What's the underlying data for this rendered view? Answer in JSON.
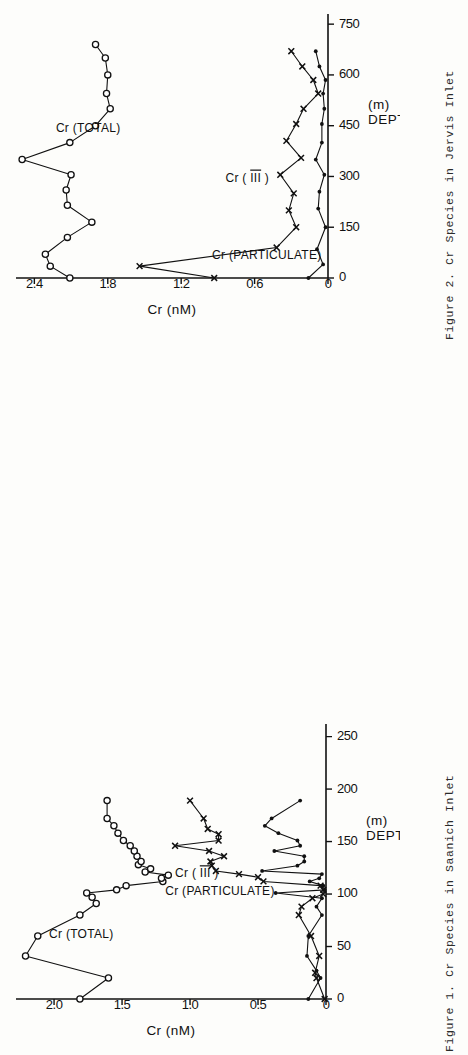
{
  "page": {
    "width": 468,
    "height": 711,
    "background_color": "#fdfdfb",
    "ink_color": "#111111",
    "orientation_note": "two landscape figures rotated 90 degrees on a portrait page"
  },
  "figures": [
    {
      "id": "figure-2",
      "caption": "Figure 2.  Cr Species in Jervis Inlet",
      "caption_number": "Figure 2.",
      "caption_text": "Cr Species in Jervis Inlet"
    },
    {
      "id": "figure-1",
      "caption": "Figure 1.  Cr Species in Saanich Inlet",
      "caption_number": "Figure 1.",
      "caption_text": "Cr Species in Saanich Inlet"
    }
  ],
  "chart_data": [
    {
      "id": "figure-2",
      "type": "line",
      "title": "Cr Species in Jervis Inlet",
      "xlabel": "DEPTH (m)",
      "ylabel": "Cr (nM)",
      "xlim": [
        0,
        780
      ],
      "ylim": [
        0,
        2.55
      ],
      "xticks": [
        0,
        150,
        300,
        450,
        600,
        750
      ],
      "xtick_labels": [
        "0",
        "150",
        "300",
        "450",
        "600",
        "750"
      ],
      "yticks": [
        0,
        0.6,
        1.2,
        1.8,
        2.4
      ],
      "ytick_labels": [
        "0",
        "0.6",
        "1.2",
        "1.8",
        "2.4"
      ],
      "grid": false,
      "legend": "inline annotations",
      "series": [
        {
          "name": "Cr (TOTAL)",
          "marker": "open-circle",
          "label_x": 430,
          "label_y": 1.96,
          "x": [
            0,
            35,
            70,
            120,
            165,
            215,
            260,
            305,
            350,
            400,
            450,
            500,
            545,
            600,
            650,
            690
          ],
          "y": [
            2.11,
            2.27,
            2.31,
            2.13,
            1.93,
            2.13,
            2.14,
            2.1,
            2.5,
            2.11,
            1.9,
            1.78,
            1.81,
            1.8,
            1.82,
            1.9
          ]
        },
        {
          "name": "Cr (III)",
          "marker": "x",
          "label_x": 285,
          "label_y": 0.66,
          "x": [
            0,
            35,
            90,
            150,
            200,
            250,
            305,
            355,
            405,
            455,
            500,
            545,
            585,
            625,
            670
          ],
          "y": [
            0.93,
            1.54,
            0.42,
            0.26,
            0.32,
            0.28,
            0.39,
            0.22,
            0.34,
            0.26,
            0.2,
            0.08,
            0.12,
            0.21,
            0.3
          ]
        },
        {
          "name": "Cr (PARTICULATE)",
          "marker": "filled-dot",
          "label_x": 55,
          "label_y": 0.5,
          "x": [
            0,
            40,
            85,
            150,
            205,
            255,
            305,
            350,
            400,
            455,
            500,
            545,
            585,
            625,
            670
          ],
          "y": [
            0.16,
            0.04,
            0.09,
            0.02,
            0.08,
            0.07,
            0.03,
            0.1,
            0.05,
            0.05,
            0.03,
            0.04,
            0.02,
            0.07,
            0.1
          ]
        }
      ]
    },
    {
      "id": "figure-1",
      "type": "line",
      "title": "Cr Species in Saanich Inlet",
      "xlabel": "DEPTH (m)",
      "ylabel": "Cr (nM)",
      "xlim": [
        0,
        262
      ],
      "ylim": [
        0,
        2.28
      ],
      "xticks": [
        0,
        50,
        100,
        150,
        200,
        250
      ],
      "xtick_labels": [
        "0",
        "50",
        "100",
        "150",
        "200",
        "250"
      ],
      "yticks": [
        0,
        0.5,
        1.0,
        1.5,
        2.0
      ],
      "ytick_labels": [
        "0",
        "0.5",
        "1.0",
        "1.5",
        "2.0"
      ],
      "grid": false,
      "legend": "inline annotations",
      "series": [
        {
          "name": "Cr (TOTAL)",
          "marker": "open-circle",
          "label_x": 58,
          "label_y": 1.8,
          "x": [
            0,
            20,
            41,
            60,
            80,
            91,
            97,
            101,
            104,
            108,
            112,
            115,
            118,
            121,
            124,
            128,
            131,
            136,
            141,
            146,
            151,
            158,
            165,
            172,
            189
          ],
          "y": [
            1.81,
            1.6,
            2.21,
            2.12,
            1.81,
            1.69,
            1.72,
            1.76,
            1.54,
            1.47,
            1.2,
            1.21,
            1.16,
            1.33,
            1.29,
            1.38,
            1.36,
            1.39,
            1.41,
            1.44,
            1.49,
            1.53,
            1.56,
            1.61,
            1.61
          ]
        },
        {
          "name": "Cr (III)",
          "marker": "x",
          "label_x": 116,
          "label_y": 0.95,
          "x": [
            0,
            20,
            25,
            41,
            60,
            80,
            88,
            96,
            100,
            104,
            108,
            112,
            116,
            119,
            122,
            127,
            131,
            136,
            141,
            146,
            151,
            157,
            162,
            172,
            189
          ],
          "y": [
            0.01,
            0.07,
            0.08,
            0.05,
            0.11,
            0.2,
            0.18,
            0.1,
            0.02,
            0.02,
            0.04,
            0.46,
            0.5,
            0.64,
            0.81,
            0.84,
            0.85,
            0.75,
            0.86,
            1.11,
            0.79,
            0.79,
            0.87,
            0.9,
            1.0
          ]
        },
        {
          "name": "Cr (PARTICULATE)",
          "marker": "filled-dot",
          "label_x": 99,
          "label_y": 0.78,
          "x": [
            0,
            20,
            27,
            41,
            60,
            80,
            88,
            96,
            101,
            104,
            108,
            112,
            115,
            119,
            122,
            127,
            131,
            136,
            141,
            146,
            151,
            158,
            165,
            172,
            189
          ],
          "y": [
            0.13,
            0.04,
            0.07,
            0.14,
            0.13,
            0.03,
            0.07,
            0.03,
            0.37,
            0.01,
            0.02,
            0.12,
            0.05,
            0.03,
            0.47,
            0.21,
            0.16,
            0.16,
            0.38,
            0.19,
            0.21,
            0.35,
            0.45,
            0.4,
            0.19
          ]
        }
      ]
    }
  ]
}
